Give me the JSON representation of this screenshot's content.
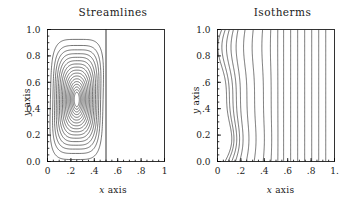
{
  "figure": {
    "background": "#ffffff",
    "line_color": "#2a2a2a",
    "axis_color": "#000000"
  },
  "panels": [
    {
      "id": "streamlines",
      "title": "Streamlines",
      "xlabel_prefix": "x",
      "xlabel_suffix": " axis",
      "ylabel_prefix": "y",
      "ylabel_suffix": " axis",
      "xticks": [
        "0",
        ".2",
        ".4",
        ".6",
        ".8",
        "1"
      ],
      "yticks": [
        "1.0",
        "0.8",
        "0.6",
        "0.4",
        "0.2",
        "0.0"
      ]
    },
    {
      "id": "isotherms",
      "title": "Isotherms",
      "xlabel_prefix": "x",
      "xlabel_suffix": " axis",
      "ylabel_prefix": "y",
      "ylabel_suffix": " axis",
      "xticks": [
        "0",
        ".2",
        ".4",
        ".6",
        ".8",
        "1."
      ],
      "yticks": [
        "1.0",
        "0.8",
        ".6",
        ".4",
        "0.2",
        "0.0"
      ]
    }
  ],
  "chart_data": [
    {
      "type": "line",
      "title": "Streamlines",
      "xlabel": "x axis",
      "ylabel": "y axis",
      "xlim": [
        0,
        1
      ],
      "ylim": [
        0,
        1
      ],
      "xticks": [
        0,
        0.2,
        0.4,
        0.6,
        0.8,
        1
      ],
      "yticks": [
        0,
        0.2,
        0.4,
        0.6,
        0.8,
        1
      ],
      "grid": false,
      "legend": "none",
      "description": "Nested closed contour loops of the stream function forming a single tall recirculating vortex confined to the left half of the cavity (0 <= x <= 0.5). A vertical boundary line is drawn at x = 0.5; the region x > 0.5 is empty.",
      "vortex_center": [
        0.25,
        0.47
      ],
      "active_region_x": [
        0.0,
        0.5
      ],
      "divider_x": 0.5,
      "n_contours": 17,
      "series": [
        {
          "name": "stream-function contour loops",
          "kind": "closed-nested-loops",
          "center": [
            0.25,
            0.47
          ],
          "outer_halfwidth_x": 0.225,
          "outer_halfheight_y": 0.455,
          "inner_halfwidth_x": 0.022,
          "inner_halfheight_y": 0.055,
          "levels": [
            0.06,
            0.12,
            0.18,
            0.24,
            0.3,
            0.36,
            0.42,
            0.48,
            0.54,
            0.6,
            0.66,
            0.72,
            0.78,
            0.84,
            0.9,
            0.95,
            1.0
          ]
        }
      ]
    },
    {
      "type": "line",
      "title": "Isotherms",
      "xlabel": "x axis",
      "ylabel": "y axis",
      "xlim": [
        0,
        1
      ],
      "ylim": [
        0,
        1
      ],
      "xticks": [
        0,
        0.2,
        0.4,
        0.6,
        0.8,
        1
      ],
      "yticks": [
        0,
        0.2,
        0.4,
        0.6,
        0.8,
        1
      ],
      "grid": false,
      "legend": "none",
      "description": "Near-vertical isotherm contours spanning the full cavity. Lines at small x are strongly S-shaped/wavy due to convection, progressively straightening into uniform vertical lines for x greater than about 0.55.",
      "n_contours": 17,
      "series": [
        {
          "name": "isotherm contours",
          "kind": "near-vertical-curves",
          "base_x": [
            0.035,
            0.065,
            0.1,
            0.135,
            0.175,
            0.235,
            0.305,
            0.385,
            0.455,
            0.515,
            0.565,
            0.625,
            0.685,
            0.745,
            0.805,
            0.865,
            0.925
          ],
          "wavy_through_index": 8,
          "wave_amplitude_x": 0.085
        }
      ]
    }
  ]
}
